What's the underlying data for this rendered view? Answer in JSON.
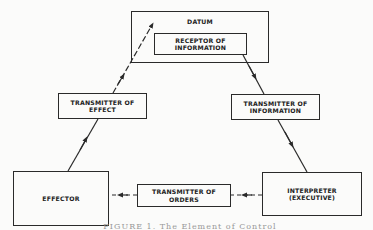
{
  "diagram": {
    "type": "feedback-loop",
    "nodes": {
      "datum": {
        "label": "DATUM"
      },
      "receptor": {
        "label": "RECEPTOR OF\nINFORMATION"
      },
      "transmitter_effect": {
        "label": "TRANSMITTER OF\nEFFECT"
      },
      "transmitter_information": {
        "label": "TRANSMITTER OF\nINFORMATION"
      },
      "effector": {
        "label": "EFFECTOR"
      },
      "transmitter_orders": {
        "label": "TRANSMITTER OF\nORDERS"
      },
      "interpreter": {
        "label": "INTERPRETER\n(EXECUTIVE)"
      }
    },
    "edges": [
      {
        "from": "receptor",
        "to": "transmitter_information",
        "style": "solid",
        "arrow": "mid"
      },
      {
        "from": "transmitter_information",
        "to": "interpreter",
        "style": "solid",
        "arrow": "mid"
      },
      {
        "from": "interpreter",
        "to": "transmitter_orders",
        "style": "dashed",
        "arrow": "mid"
      },
      {
        "from": "transmitter_orders",
        "to": "effector",
        "style": "dashed",
        "arrow": "mid"
      },
      {
        "from": "effector",
        "to": "transmitter_effect",
        "style": "solid",
        "arrow": "mid"
      },
      {
        "from": "transmitter_effect",
        "to": "datum",
        "style": "dashed",
        "arrow": "end"
      }
    ],
    "caption": "FIGURE 1. The Element of Control",
    "colors": {
      "line": "#2a2a2a",
      "background": "#fbfbfa"
    }
  }
}
